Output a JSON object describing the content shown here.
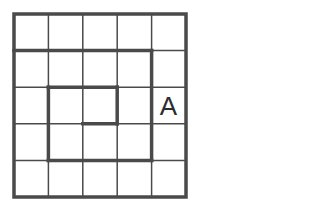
{
  "diagram": {
    "type": "grid-puzzle",
    "rows": 5,
    "cols": 5,
    "line_color": "#4a4a4a",
    "thin_width": 1.5,
    "thick_width": 3.5,
    "frame": {
      "x": 14,
      "y": 14,
      "w": 172,
      "h": 183
    },
    "thick_segments": [
      {
        "from": [
          0,
          1
        ],
        "to": [
          4,
          1
        ]
      },
      {
        "from": [
          4,
          1
        ],
        "to": [
          4,
          4
        ]
      },
      {
        "from": [
          1,
          4
        ],
        "to": [
          4,
          4
        ]
      },
      {
        "from": [
          1,
          2
        ],
        "to": [
          1,
          4
        ]
      },
      {
        "from": [
          1,
          2
        ],
        "to": [
          3,
          2
        ]
      },
      {
        "from": [
          3,
          2
        ],
        "to": [
          3,
          3
        ]
      },
      {
        "from": [
          2,
          3
        ],
        "to": [
          3,
          3
        ]
      }
    ],
    "cell_labels": [
      {
        "row": 2,
        "col": 4,
        "text": "A"
      }
    ]
  }
}
